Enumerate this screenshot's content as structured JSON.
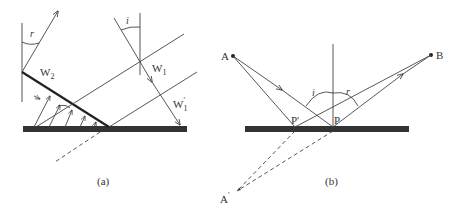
{
  "panel_a": {
    "caption": "(a)",
    "labels": {
      "angle_r": "r",
      "angle_i": "i",
      "wavefront_w2": "W",
      "wavefront_w2_sub": "2",
      "wavefront_w1": "W",
      "wavefront_w1_sub": "1",
      "wavefront_w1p": "W",
      "wavefront_w1p_sub": "1",
      "wavefront_w1p_prime": "'"
    }
  },
  "panel_b": {
    "caption": "(b)",
    "labels": {
      "point_a": "A",
      "point_b": "B",
      "point_a_image": "A",
      "point_a_image_prime": "'",
      "point_p": "P",
      "point_p_prime": "P'",
      "angle_i": "i",
      "angle_r": "r"
    }
  },
  "colors": {
    "ink": "#333333",
    "mirror": "#333333",
    "background": "#ffffff"
  }
}
